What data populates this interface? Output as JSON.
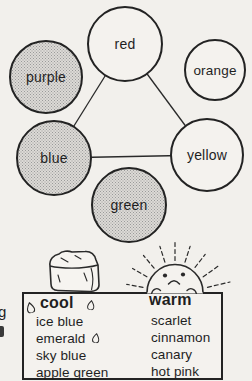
{
  "figure": {
    "kind": "color-wheel-diagram-with-temperature-table"
  },
  "circles": [
    {
      "label": "red",
      "shaded": false
    },
    {
      "label": "orange",
      "shaded": false
    },
    {
      "label": "purple",
      "shaded": true
    },
    {
      "label": "blue",
      "shaded": true
    },
    {
      "label": "yellow",
      "shaded": false
    },
    {
      "label": "green",
      "shaded": true
    }
  ],
  "table": {
    "columns": [
      {
        "header": "cool",
        "icon": "ice-cube-icon",
        "items": [
          "ice blue",
          "emerald",
          "sky blue",
          "apple green"
        ]
      },
      {
        "header": "warm",
        "icon": "sun-icon",
        "items": [
          "scarlet",
          "cinnamon",
          "canary",
          "hot pink"
        ]
      }
    ]
  },
  "margin_fragment": "g",
  "colors": {
    "ink": "#1f1f1f",
    "paper": "#f2f0ec",
    "shade_dot": "#9a9a9a",
    "shade_bg": "#dcdad6"
  }
}
